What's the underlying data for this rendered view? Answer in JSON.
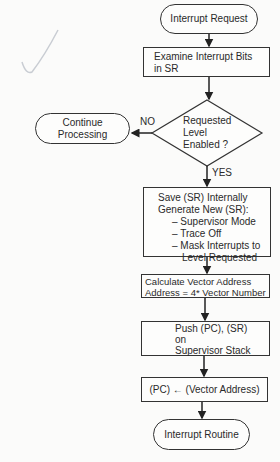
{
  "flowchart": {
    "start": "Interrupt Request",
    "examine": [
      "Examine Interrupt Bits",
      "in SR"
    ],
    "decision": [
      "Requested",
      "Level",
      "Enabled ?"
    ],
    "no_label": "NO",
    "yes_label": "YES",
    "no_branch": [
      "Continue",
      "Processing"
    ],
    "save_box": {
      "line1": "Save (SR) Internally",
      "line2": "Generate New (SR):",
      "items": [
        "– Supervisor Mode",
        "– Trace Off",
        "– Mask Interrupts to",
        "Level Requested"
      ]
    },
    "calc_box": [
      "Calculate Vector Address",
      "Address = 4* Vector Number"
    ],
    "push_box": [
      "Push (PC), (SR)",
      "on",
      "Supervisor Stack"
    ],
    "pc_box": "(PC) ← (Vector Address)",
    "end": "Interrupt Routine"
  }
}
